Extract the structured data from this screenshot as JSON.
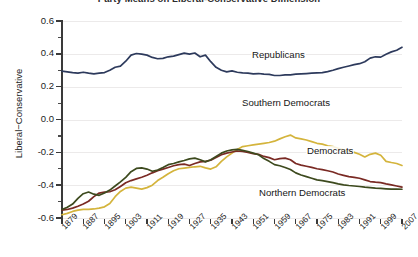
{
  "chart_data": {
    "type": "line",
    "title": "Party Means on Liberal-Conservative Dimension",
    "xlabel": "",
    "ylabel": "Liberal−Conservative",
    "xlim": [
      1879,
      2007
    ],
    "ylim": [
      -0.6,
      0.6
    ],
    "grid": true,
    "legend_position": "inline-annotations",
    "y_ticks": [
      "0.6",
      "0.4",
      "0.2",
      "0.0",
      "-0.2",
      "-0.4",
      "-0.6"
    ],
    "y_tick_values": [
      0.6,
      0.4,
      0.2,
      0.0,
      -0.2,
      -0.4,
      -0.6
    ],
    "y_minor_tick_values": [
      0.5,
      0.3,
      0.1,
      -0.1,
      -0.3,
      -0.5
    ],
    "x_ticks": [
      "1879",
      "1887",
      "1895",
      "1903",
      "1911",
      "1919",
      "1927",
      "1935",
      "1943",
      "1951",
      "1959",
      "1967",
      "1975",
      "1983",
      "1991",
      "1999",
      "2007"
    ],
    "x_tick_values": [
      1879,
      1887,
      1895,
      1903,
      1911,
      1919,
      1927,
      1935,
      1943,
      1951,
      1959,
      1967,
      1975,
      1983,
      1991,
      1999,
      2007
    ],
    "x": [
      1879,
      1881,
      1883,
      1885,
      1887,
      1889,
      1891,
      1893,
      1895,
      1897,
      1899,
      1901,
      1903,
      1905,
      1907,
      1909,
      1911,
      1913,
      1915,
      1917,
      1919,
      1921,
      1923,
      1925,
      1927,
      1929,
      1931,
      1933,
      1935,
      1937,
      1939,
      1941,
      1943,
      1945,
      1947,
      1949,
      1951,
      1953,
      1955,
      1957,
      1959,
      1961,
      1963,
      1965,
      1967,
      1969,
      1971,
      1973,
      1975,
      1977,
      1979,
      1981,
      1983,
      1985,
      1987,
      1989,
      1991,
      1993,
      1995,
      1997,
      1999,
      2001,
      2003,
      2005,
      2007
    ],
    "series": [
      {
        "name": "Republicans",
        "color": "#2d3a5c",
        "values": [
          0.295,
          0.29,
          0.285,
          0.283,
          0.288,
          0.282,
          0.278,
          0.282,
          0.286,
          0.3,
          0.318,
          0.325,
          0.355,
          0.392,
          0.402,
          0.398,
          0.392,
          0.378,
          0.37,
          0.372,
          0.382,
          0.386,
          0.395,
          0.404,
          0.398,
          0.405,
          0.382,
          0.392,
          0.352,
          0.318,
          0.3,
          0.29,
          0.296,
          0.288,
          0.284,
          0.282,
          0.278,
          0.28,
          0.276,
          0.275,
          0.268,
          0.268,
          0.272,
          0.272,
          0.276,
          0.278,
          0.28,
          0.282,
          0.284,
          0.286,
          0.292,
          0.3,
          0.31,
          0.318,
          0.326,
          0.334,
          0.34,
          0.352,
          0.374,
          0.382,
          0.38,
          0.398,
          0.412,
          0.422,
          0.44
        ]
      },
      {
        "name": "Southern Democrats",
        "color": "#d4b43c",
        "values": [
          -0.58,
          -0.572,
          -0.56,
          -0.552,
          -0.548,
          -0.548,
          -0.545,
          -0.54,
          -0.532,
          -0.512,
          -0.47,
          -0.438,
          -0.418,
          -0.412,
          -0.418,
          -0.424,
          -0.415,
          -0.4,
          -0.372,
          -0.352,
          -0.33,
          -0.312,
          -0.3,
          -0.296,
          -0.292,
          -0.288,
          -0.285,
          -0.295,
          -0.302,
          -0.288,
          -0.255,
          -0.228,
          -0.205,
          -0.182,
          -0.165,
          -0.16,
          -0.155,
          -0.15,
          -0.145,
          -0.14,
          -0.132,
          -0.118,
          -0.105,
          -0.095,
          -0.112,
          -0.118,
          -0.125,
          -0.135,
          -0.145,
          -0.15,
          -0.16,
          -0.165,
          -0.175,
          -0.185,
          -0.192,
          -0.2,
          -0.212,
          -0.228,
          -0.212,
          -0.205,
          -0.218,
          -0.255,
          -0.262,
          -0.268,
          -0.28
        ]
      },
      {
        "name": "Democrats",
        "color": "#7a2a24",
        "values": [
          -0.552,
          -0.548,
          -0.54,
          -0.528,
          -0.515,
          -0.498,
          -0.47,
          -0.448,
          -0.442,
          -0.44,
          -0.428,
          -0.408,
          -0.385,
          -0.372,
          -0.362,
          -0.352,
          -0.34,
          -0.325,
          -0.312,
          -0.302,
          -0.292,
          -0.282,
          -0.275,
          -0.272,
          -0.28,
          -0.268,
          -0.258,
          -0.255,
          -0.248,
          -0.232,
          -0.215,
          -0.205,
          -0.198,
          -0.192,
          -0.195,
          -0.2,
          -0.208,
          -0.212,
          -0.225,
          -0.232,
          -0.245,
          -0.238,
          -0.235,
          -0.245,
          -0.268,
          -0.278,
          -0.285,
          -0.292,
          -0.3,
          -0.305,
          -0.312,
          -0.32,
          -0.332,
          -0.34,
          -0.348,
          -0.352,
          -0.358,
          -0.368,
          -0.378,
          -0.382,
          -0.385,
          -0.392,
          -0.398,
          -0.405,
          -0.412
        ]
      },
      {
        "name": "Northern Democrats",
        "color": "#3d4a1e",
        "values": [
          -0.548,
          -0.535,
          -0.515,
          -0.48,
          -0.452,
          -0.442,
          -0.455,
          -0.462,
          -0.448,
          -0.43,
          -0.405,
          -0.38,
          -0.352,
          -0.318,
          -0.298,
          -0.295,
          -0.302,
          -0.315,
          -0.308,
          -0.292,
          -0.275,
          -0.268,
          -0.258,
          -0.25,
          -0.24,
          -0.235,
          -0.245,
          -0.258,
          -0.245,
          -0.225,
          -0.205,
          -0.192,
          -0.185,
          -0.182,
          -0.188,
          -0.195,
          -0.205,
          -0.215,
          -0.238,
          -0.255,
          -0.275,
          -0.282,
          -0.292,
          -0.305,
          -0.325,
          -0.338,
          -0.348,
          -0.358,
          -0.368,
          -0.372,
          -0.378,
          -0.385,
          -0.392,
          -0.398,
          -0.402,
          -0.405,
          -0.408,
          -0.412,
          -0.415,
          -0.418,
          -0.42,
          -0.422,
          -0.424,
          -0.424,
          -0.425
        ]
      }
    ],
    "annotations": [
      {
        "text": "Republicans",
        "series": "Republicans"
      },
      {
        "text": "Southern Democrats",
        "series": "Southern Democrats"
      },
      {
        "text": "Democrats",
        "series": "Democrats"
      },
      {
        "text": "Northern Democrats",
        "series": "Northern Democrats"
      }
    ]
  }
}
